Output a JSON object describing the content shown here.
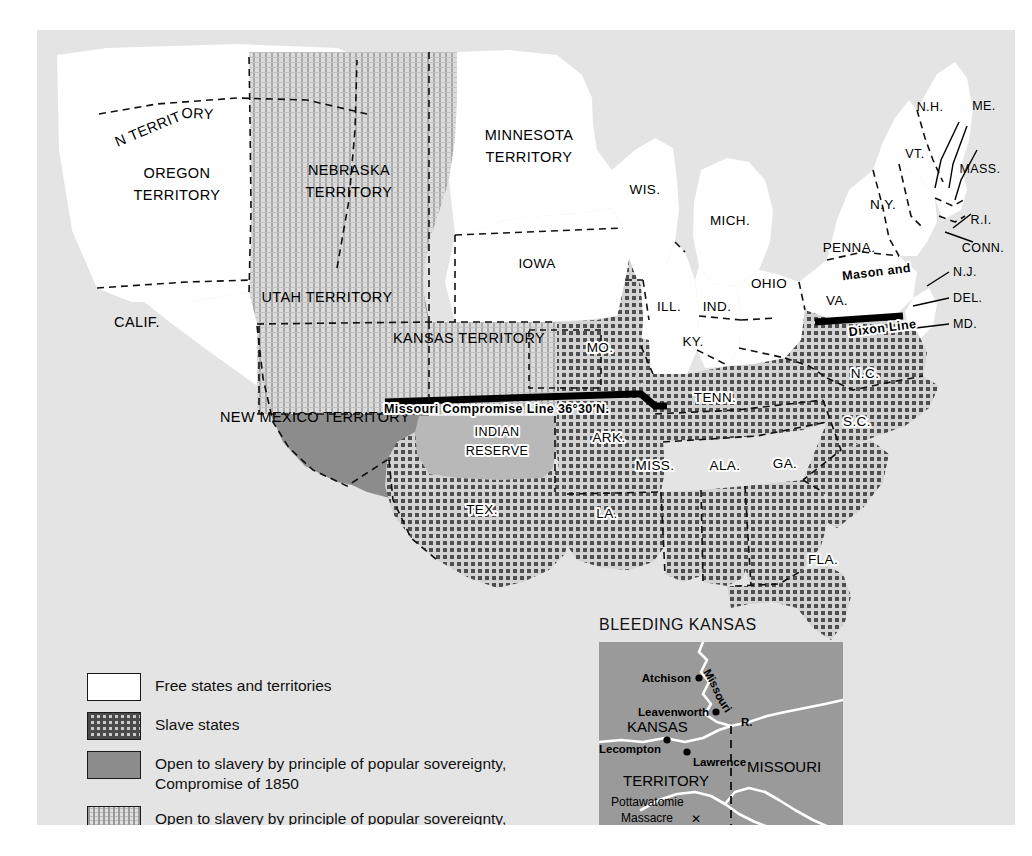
{
  "map": {
    "background_color": "#e6e6e6",
    "ocean_color": "#e4e4e4",
    "labels": {
      "washington_territory": "WASHINGTON TERRITORY",
      "oregon_territory_l1": "OREGON",
      "oregon_territory_l2": "TERRITORY",
      "calif": "CALIF.",
      "utah_territory": "UTAH TERRITORY",
      "new_mexico_territory": "NEW MEXICO TERRITORY",
      "nebraska_territory_l1": "NEBRASKA",
      "nebraska_territory_l2": "TERRITORY",
      "minnesota_territory_l1": "MINNESOTA",
      "minnesota_territory_l2": "TERRITORY",
      "kansas_territory": "KANSAS TERRITORY",
      "indian_reserve_l1": "INDIAN",
      "indian_reserve_l2": "RESERVE",
      "wis": "WIS.",
      "iowa": "IOWA",
      "mich": "MICH.",
      "ill": "ILL.",
      "ind": "IND.",
      "ohio": "OHIO",
      "mo": "MO.",
      "ark": "ARK.",
      "tex": "TEX.",
      "la": "LA.",
      "miss": "MISS.",
      "ala": "ALA.",
      "ga": "GA.",
      "fla": "FLA.",
      "tenn": "TENN.",
      "ky": "KY.",
      "va": "VA.",
      "nc": "N.C.",
      "sc": "S.C.",
      "penna": "PENNA.",
      "ny": "N.Y.",
      "vt": "VT.",
      "nh": "N.H.",
      "me": "ME.",
      "mass": "MASS.",
      "ri": "R.I.",
      "conn": "CONN.",
      "nj": "N.J.",
      "del": "DEL.",
      "md": "MD.",
      "mason_dixon_l1": "Mason and",
      "mason_dixon_l2": "Dixon Line",
      "missouri_compromise": "Missouri Compromise Line 36°30′N."
    }
  },
  "legend": {
    "items": [
      {
        "swatch": "free",
        "lines": [
          "Free states and territories"
        ]
      },
      {
        "swatch": "slave",
        "lines": [
          "Slave states"
        ]
      },
      {
        "swatch": "pop1850",
        "lines": [
          "Open to slavery by principle of popular sovereignty,",
          "Compromise of 1850"
        ]
      },
      {
        "swatch": "kn1854",
        "lines": [
          "Open to slavery by principle of popular sovereignty,",
          "Kansas–Nebraska Act, 1854"
        ]
      }
    ],
    "free_label": "Free states and territories",
    "slave_label": "Slave states",
    "pop1850_line1": "Open to slavery by principle of popular sovereignty,",
    "pop1850_line2": "Compromise of 1850",
    "kn1854_line1": "Open to slavery by principle of popular sovereignty,",
    "kn1854_line2": "Kansas–Nebraska Act, 1854"
  },
  "inset": {
    "title": "BLEEDING KANSAS",
    "land_color": "#9a9a9a",
    "labels": {
      "kansas": "KANSAS",
      "territory": "TERRITORY",
      "missouri_state": "MISSOURI",
      "missouri_river": "Missouri",
      "missouri_river_abbr": "R.",
      "atchison": "Atchison",
      "leavenworth": "Leavenworth",
      "lecompton": "Lecompton",
      "lawrence": "Lawrence",
      "pottawatomie_l1": "Pottawatomie",
      "pottawatomie_l2": "Massacre",
      "massacre_marker": "✕"
    }
  },
  "colors": {
    "free": "#ffffff",
    "slave_pattern_ink": "#4a4a4a",
    "popular_sovereignty_1850": "#8c8c8c",
    "kansas_nebraska_1854": "#cfcfcf",
    "indian_reserve": "#b8b8b8",
    "border_ink": "#111111"
  }
}
